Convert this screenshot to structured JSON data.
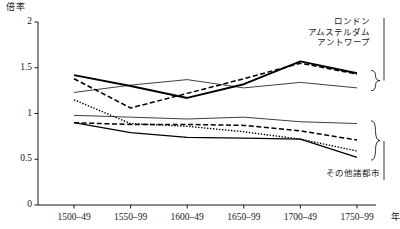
{
  "chart_data": {
    "type": "line",
    "title": "",
    "ylabel": "倍率",
    "xlabel": "年",
    "ylim": [
      0,
      2
    ],
    "yticks": [
      0,
      0.5,
      1,
      1.5,
      2
    ],
    "ytick_labels": [
      "0",
      "0.5",
      "1",
      "1.5",
      "2"
    ],
    "categories": [
      "1500–49",
      "1550–99",
      "1600–49",
      "1650–99",
      "1700–49",
      "1750–99"
    ],
    "grid": false,
    "legend_position": "right",
    "group_labels": {
      "upper": [
        "ロンドン",
        "アムステルダム",
        "アントワープ"
      ],
      "lower": [
        "その他諸都市"
      ]
    },
    "series": [
      {
        "name": "ロンドン",
        "group": "upper",
        "style": "solid-thick",
        "values": [
          1.42,
          1.3,
          1.17,
          1.32,
          1.57,
          1.44
        ]
      },
      {
        "name": "アムステルダム",
        "group": "upper",
        "style": "dashed",
        "values": [
          1.38,
          1.06,
          1.22,
          1.38,
          1.55,
          1.43
        ]
      },
      {
        "name": "アントワープ",
        "group": "upper",
        "style": "solid-thin",
        "values": [
          1.23,
          1.31,
          1.37,
          1.28,
          1.34,
          1.28
        ]
      },
      {
        "name": "その他諸都市1",
        "group": "lower",
        "style": "solid-thin",
        "values": [
          0.98,
          0.96,
          0.94,
          0.96,
          0.91,
          0.89
        ]
      },
      {
        "name": "その他諸都市2",
        "group": "lower",
        "style": "dashed",
        "values": [
          0.9,
          0.88,
          0.88,
          0.87,
          0.81,
          0.71
        ]
      },
      {
        "name": "その他諸都市3",
        "group": "lower",
        "style": "dotted",
        "values": [
          1.15,
          0.89,
          0.86,
          0.8,
          0.72,
          0.59
        ]
      },
      {
        "name": "その他諸都市4",
        "group": "lower",
        "style": "solid-med",
        "values": [
          0.9,
          0.79,
          0.74,
          0.73,
          0.72,
          0.52
        ]
      }
    ]
  },
  "axes": {
    "y_title": "倍率",
    "x_title": "年"
  },
  "legend": {
    "upper_items": [
      "ロンドン",
      "アムステルダム",
      "アントワープ"
    ],
    "lower_items": [
      "その他諸都市"
    ]
  }
}
